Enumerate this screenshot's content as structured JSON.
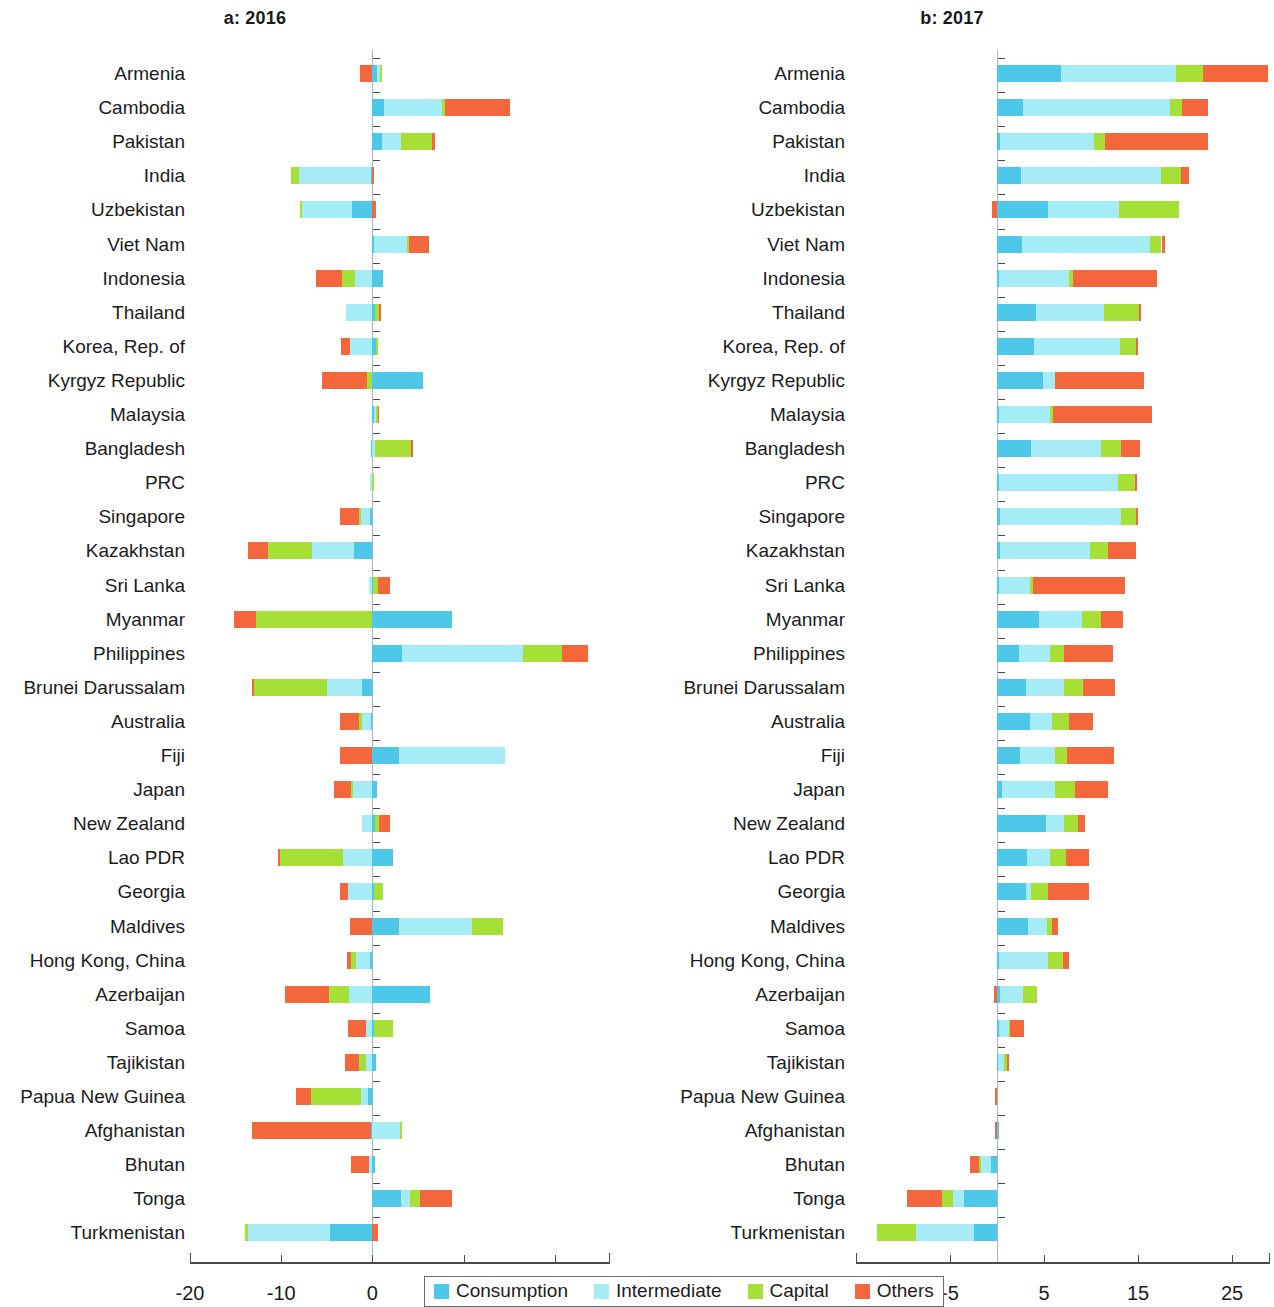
{
  "figure": {
    "panels": [
      {
        "id": "a",
        "title": "a: 2016"
      },
      {
        "id": "b",
        "title": "b: 2017"
      }
    ]
  },
  "legend": {
    "items": [
      {
        "label": "Consumption",
        "color": "#4ec8e8"
      },
      {
        "label": "Intermediate",
        "color": "#a6ecf7"
      },
      {
        "label": "Capital",
        "color": "#a6e036"
      },
      {
        "label": "Others",
        "color": "#f4663c"
      }
    ]
  },
  "colors": {
    "consumption": "#4ec8e8",
    "intermediate": "#a6ecf7",
    "capital": "#a6e036",
    "others": "#f4663c",
    "axis": "#4a4a4a",
    "zero_line": "#9fb9c6",
    "text": "#1c1c1c"
  },
  "chart_data": [
    {
      "type": "bar",
      "orientation": "horizontal",
      "stacked": true,
      "diverging": true,
      "panel": "a",
      "title": "a: 2016",
      "xlabel": "",
      "ylabel": "",
      "xlim": [
        -22,
        26
      ],
      "xticks": [
        -20,
        -10,
        0,
        10,
        20
      ],
      "xticklabels": [
        "-20",
        "-10",
        "0",
        "10",
        "20"
      ],
      "grid": false,
      "legend_position": "bottom",
      "categories": [
        "Armenia",
        "Cambodia",
        "Pakistan",
        "India",
        "Uzbekistan",
        "Viet Nam",
        "Indonesia",
        "Thailand",
        "Korea, Rep. of",
        "Kyrgyz Republic",
        "Malaysia",
        "Bangladesh",
        "PRC",
        "Singapore",
        "Kazakhstan",
        "Sri Lanka",
        "Myanmar",
        "Philippines",
        "Brunei Darussalam",
        "Australia",
        "Fiji",
        "Japan",
        "New Zealand",
        "Lao PDR",
        "Georgia",
        "Maldives",
        "Hong Kong, China",
        "Azerbaijan",
        "Samoa",
        "Tajikistan",
        "Papua New Guinea",
        "Afghanistan",
        "Bhutan",
        "Tonga",
        "Turkmenistan"
      ],
      "series": [
        {
          "name": "Consumption",
          "values": [
            0.5,
            1.3,
            1.1,
            -0.2,
            -2.2,
            0.2,
            1.2,
            0.3,
            0.4,
            5.6,
            0.2,
            -0.1,
            0.0,
            -0.3,
            -2.0,
            0.1,
            8.7,
            3.3,
            -1.1,
            -0.2,
            2.9,
            0.5,
            0.3,
            2.3,
            0.2,
            2.9,
            -0.3,
            6.3,
            0.2,
            0.4,
            -0.5,
            -0.2,
            0.3,
            3.1,
            -4.6
          ]
        },
        {
          "name": "Intermediate",
          "values": [
            0.3,
            6.3,
            2.0,
            -7.8,
            -5.5,
            3.6,
            -1.9,
            -2.9,
            -2.5,
            0.0,
            0.2,
            0.3,
            -0.3,
            -0.9,
            -4.6,
            -0.4,
            0.0,
            13.2,
            -3.9,
            -0.9,
            11.6,
            -2.1,
            -1.1,
            -3.2,
            -2.7,
            8.0,
            -1.5,
            -2.6,
            -0.7,
            -0.7,
            -0.8,
            3.0,
            -0.4,
            1.0,
            -9.0
          ]
        },
        {
          "name": "Capital",
          "values": [
            0.2,
            0.4,
            3.4,
            -0.9,
            -0.2,
            0.2,
            -1.4,
            0.4,
            0.1,
            -0.6,
            0.2,
            3.9,
            0.2,
            -0.3,
            -4.8,
            0.5,
            -12.8,
            4.3,
            -8.1,
            -0.4,
            0.0,
            -0.3,
            0.4,
            -6.9,
            1.0,
            3.4,
            -0.5,
            -2.2,
            2.1,
            -0.8,
            -5.4,
            0.2,
            0.0,
            1.1,
            -0.4
          ]
        },
        {
          "name": "Others",
          "values": [
            -1.4,
            7.1,
            0.4,
            0.1,
            0.4,
            2.2,
            -2.9,
            0.2,
            -0.9,
            -4.9,
            0.1,
            0.2,
            0.0,
            -2.0,
            -2.2,
            1.3,
            -2.4,
            2.8,
            -0.1,
            -2.0,
            -3.5,
            -1.8,
            1.2,
            -0.2,
            -0.8,
            -2.5,
            -0.5,
            -4.8,
            -2.0,
            -1.5,
            -1.7,
            -13.0,
            -1.9,
            3.5,
            0.6
          ]
        }
      ]
    },
    {
      "type": "bar",
      "orientation": "horizontal",
      "stacked": true,
      "diverging": true,
      "panel": "b",
      "title": "b: 2017",
      "xlabel": "",
      "ylabel": "",
      "xlim": [
        -15,
        28
      ],
      "xticks": [
        -15,
        -5,
        5,
        15,
        25
      ],
      "xticklabels": [
        "-15",
        "-5",
        "5",
        "15",
        "25"
      ],
      "grid": false,
      "legend_position": "bottom",
      "categories": [
        "Armenia",
        "Cambodia",
        "Pakistan",
        "India",
        "Uzbekistan",
        "Viet Nam",
        "Indonesia",
        "Thailand",
        "Korea, Rep. of",
        "Kyrgyz Republic",
        "Malaysia",
        "Bangladesh",
        "PRC",
        "Singapore",
        "Kazakhstan",
        "Sri Lanka",
        "Myanmar",
        "Philippines",
        "Brunei Darussalam",
        "Australia",
        "Fiji",
        "Japan",
        "New Zealand",
        "Lao PDR",
        "Georgia",
        "Maldives",
        "Hong Kong, China",
        "Azerbaijan",
        "Samoa",
        "Tajikistan",
        "Papua New Guinea",
        "Afghanistan",
        "Bhutan",
        "Tonga",
        "Turkmenistan"
      ],
      "series": [
        {
          "name": "Consumption",
          "values": [
            6.8,
            2.8,
            0.3,
            2.5,
            5.4,
            2.7,
            0.2,
            4.1,
            3.9,
            4.9,
            0.2,
            3.6,
            0.2,
            0.3,
            0.3,
            0.2,
            4.5,
            2.3,
            3.1,
            3.5,
            2.4,
            0.5,
            5.2,
            3.2,
            3.1,
            3.3,
            0.2,
            0.3,
            0.2,
            0.1,
            0.0,
            0.1,
            -0.6,
            -3.5,
            -2.4
          ]
        },
        {
          "name": "Intermediate",
          "values": [
            12.2,
            15.6,
            10.0,
            14.9,
            7.6,
            13.6,
            7.5,
            7.3,
            9.2,
            1.3,
            5.4,
            7.5,
            12.7,
            12.9,
            9.6,
            3.3,
            4.5,
            3.3,
            4.0,
            2.4,
            3.8,
            5.7,
            1.9,
            2.4,
            0.5,
            2.0,
            5.2,
            2.5,
            1.1,
            0.6,
            0.0,
            0.0,
            -1.1,
            -1.2,
            -6.2
          ]
        },
        {
          "name": "Capital",
          "values": [
            2.9,
            1.3,
            1.2,
            2.2,
            6.4,
            1.2,
            0.4,
            3.7,
            1.7,
            0.0,
            0.4,
            2.1,
            1.8,
            1.6,
            1.9,
            0.3,
            2.1,
            1.5,
            2.0,
            1.8,
            1.2,
            2.1,
            1.5,
            1.7,
            1.8,
            0.6,
            1.6,
            1.5,
            0.1,
            0.4,
            0.0,
            0.0,
            -0.2,
            -1.1,
            -4.2
          ]
        },
        {
          "name": "Others",
          "values": [
            6.9,
            2.7,
            11.0,
            0.8,
            -0.5,
            0.4,
            8.9,
            0.2,
            0.2,
            9.4,
            10.5,
            2.0,
            0.2,
            0.2,
            3.0,
            9.8,
            2.3,
            5.2,
            3.5,
            2.5,
            5.0,
            3.5,
            0.8,
            2.5,
            4.4,
            0.6,
            0.7,
            -0.3,
            1.5,
            0.1,
            -0.2,
            -0.2,
            -1.0,
            -3.8,
            0.0
          ]
        }
      ]
    }
  ]
}
